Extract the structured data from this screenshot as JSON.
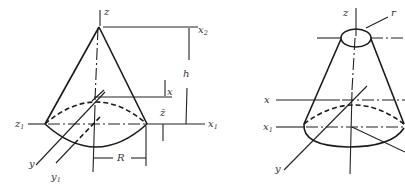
{
  "figure": {
    "left": {
      "title": "Right circular cone",
      "labels": {
        "z": "z",
        "x2": "x",
        "x2_sub": "2",
        "h": "h",
        "x": "x",
        "zbar": "z̄",
        "z1": "z",
        "z1_sub": "1",
        "x1": "x",
        "x1_sub": "1",
        "y": "y",
        "y1": "y",
        "y1_sub": "1",
        "R": "R"
      }
    },
    "right": {
      "title": "Frustum of cone",
      "labels": {
        "z": "z",
        "r": "r",
        "x": "x",
        "x1": "x",
        "x1_sub": "1",
        "y": "y"
      }
    },
    "stroke_color": "#1a1a1a",
    "background": "#ffffff"
  }
}
